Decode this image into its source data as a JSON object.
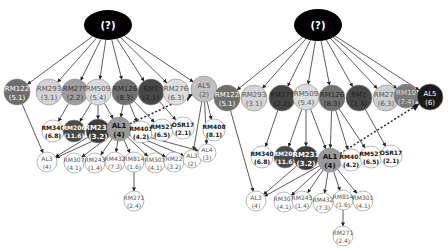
{
  "diagrams": [
    {
      "id": "left",
      "root": {
        "label": "(?)",
        "cx": 108,
        "cy": 25,
        "rx": 24,
        "ry": 15
      },
      "nodes": [
        {
          "id": "RM122",
          "name": "RM122",
          "value": "(5.1)",
          "x": 17,
          "y": 92,
          "r": 13,
          "fill": "#6e6e6e",
          "text": "#ffffff"
        },
        {
          "id": "RM293",
          "name": "RM293",
          "value": "(3.1)",
          "x": 49,
          "y": 92,
          "r": 13,
          "fill": "#d4d4d4",
          "text": "#555555"
        },
        {
          "id": "RM279",
          "name": "RM279",
          "value": "(2.2)",
          "x": 75,
          "y": 92,
          "r": 13,
          "fill": "#9e9e9e",
          "text": "#333333"
        },
        {
          "id": "RM509",
          "name": "RM509",
          "value": "(5.4)",
          "x": 98,
          "y": 92,
          "r": 13,
          "fill": "#dcdcdc",
          "text": "#555555"
        },
        {
          "id": "RM126",
          "name": "RM126",
          "value": "(8.3)",
          "x": 125,
          "y": 92,
          "r": 13,
          "fill": "#707070",
          "text": "#222222"
        },
        {
          "id": "RM1",
          "name": "RM1",
          "value": "(1.1)",
          "x": 151,
          "y": 92,
          "r": 13,
          "fill": "#474747",
          "text": "#222222"
        },
        {
          "id": "RM276",
          "name": "RM276",
          "value": "(6.3)",
          "x": 176,
          "y": 92,
          "r": 13,
          "fill": "#dedede",
          "text": "#555555"
        },
        {
          "id": "AL5",
          "name": "AL5",
          "value": "(2)",
          "x": 204,
          "y": 89,
          "r": 13,
          "fill": "#c0c0c0",
          "text": "#555555"
        },
        {
          "id": "RM340",
          "name": "RM340",
          "value": "(6.8)",
          "x": 53,
          "y": 131,
          "r": 11,
          "fill": "#ffffff",
          "text": "#111111",
          "bold": true
        },
        {
          "id": "RM206",
          "name": "RM206",
          "value": "(11.6)",
          "x": 74,
          "y": 131,
          "r": 11,
          "fill": "#4a4a4a",
          "text": "#ffffff",
          "bold": true
        },
        {
          "id": "RM231",
          "name": "RM231",
          "value": "(3.2)",
          "x": 98,
          "y": 131,
          "r": 12,
          "fill": "#3c3c3c",
          "text": "#ffffff",
          "bold": true
        },
        {
          "id": "AL1",
          "name": "AL1",
          "value": "(4)",
          "x": 119,
          "y": 129,
          "r": 12,
          "fill": "#9a9a9a",
          "text": "#111111",
          "bold": true
        },
        {
          "id": "RM401",
          "name": "RM401",
          "value": "(4.2)",
          "x": 141,
          "y": 132,
          "r": 11,
          "fill": "#ffffff",
          "text": "#111111",
          "bold": true
        },
        {
          "id": "RM527",
          "name": "RM527",
          "value": "(6.5)",
          "x": 162,
          "y": 130,
          "r": 11,
          "fill": "#ffffff",
          "text": "#111111",
          "bold": true
        },
        {
          "id": "OSR17",
          "name": "OSR17",
          "value": "(2.1)",
          "x": 183,
          "y": 128,
          "r": 11,
          "fill": "#ffffff",
          "text": "#111111",
          "bold": true
        },
        {
          "id": "RM408",
          "name": "RM408",
          "value": "(8.1)",
          "x": 214,
          "y": 130,
          "r": 11,
          "fill": "#ffffff",
          "text": "#111111",
          "bold": true
        },
        {
          "id": "AL3a",
          "name": "AL3",
          "value": "(4)",
          "x": 47,
          "y": 162,
          "r": 10,
          "fill": "#ffffff",
          "text": "#555555"
        },
        {
          "id": "RM307",
          "name": "RM307",
          "value": "(4.1)",
          "x": 74,
          "y": 163,
          "r": 10,
          "fill": "#ffffff",
          "text": "#555555"
        },
        {
          "id": "RM243",
          "name": "RM243",
          "value": "(1.4)",
          "x": 95,
          "y": 163,
          "r": 10,
          "fill": "#ffffff",
          "text": "#555555"
        },
        {
          "id": "RM432",
          "name": "RM432",
          "value": "(7.3)",
          "x": 115,
          "y": 162,
          "r": 10,
          "fill": "#ffffff",
          "text": "#555555"
        },
        {
          "id": "RM814",
          "name": "RM814",
          "value": "(1.6)",
          "x": 134,
          "y": 162,
          "r": 10,
          "fill": "#ffffff",
          "text": "#555555"
        },
        {
          "id": "RM301",
          "name": "RM301",
          "value": "(4.1)",
          "x": 155,
          "y": 163,
          "r": 10,
          "fill": "#ffffff",
          "text": "#555555"
        },
        {
          "id": "RM22",
          "name": "RM22",
          "value": "(3.2)",
          "x": 174,
          "y": 162,
          "r": 10,
          "fill": "#ffffff",
          "text": "#555555"
        },
        {
          "id": "AL3b",
          "name": "AL3",
          "value": "(2)",
          "x": 192,
          "y": 159,
          "r": 9,
          "fill": "#ffffff",
          "text": "#555555"
        },
        {
          "id": "AL4",
          "name": "AL4",
          "value": "(3)",
          "x": 207,
          "y": 153,
          "r": 9,
          "fill": "#ffffff",
          "text": "#555555"
        },
        {
          "id": "RM271",
          "name": "RM271",
          "value": "(2.4)",
          "x": 134,
          "y": 201,
          "r": 10,
          "fill": "#ffffff",
          "text": "#555555"
        }
      ],
      "edges": [
        [
          "root",
          "RM122"
        ],
        [
          "root",
          "RM293"
        ],
        [
          "root",
          "RM279"
        ],
        [
          "root",
          "RM509"
        ],
        [
          "root",
          "RM126"
        ],
        [
          "root",
          "RM1"
        ],
        [
          "root",
          "RM276"
        ],
        [
          "root",
          "AL5"
        ],
        [
          "RM279",
          "RM340"
        ],
        [
          "RM509",
          "RM206"
        ],
        [
          "RM509",
          "RM231"
        ],
        [
          "RM509",
          "AL1"
        ],
        [
          "RM126",
          "AL1"
        ],
        [
          "RM126",
          "RM401"
        ],
        [
          "RM126",
          "RM527"
        ],
        [
          "RM1",
          "OSR17"
        ],
        [
          "AL5",
          "RM408"
        ],
        [
          "AL5",
          "AL3b"
        ],
        [
          "AL5",
          "AL4"
        ],
        [
          "RM122",
          "AL3a"
        ],
        [
          "RM231",
          "AL3a"
        ],
        [
          "AL1",
          "AL3a"
        ],
        [
          "AL1",
          "RM307"
        ],
        [
          "AL1",
          "RM243"
        ],
        [
          "AL1",
          "RM432"
        ],
        [
          "AL1",
          "RM814"
        ],
        [
          "AL1",
          "RM301"
        ],
        [
          "AL1",
          "RM22"
        ],
        [
          "AL1",
          "AL3b"
        ],
        [
          "AL1",
          "AL4"
        ],
        [
          "RM814",
          "RM271"
        ]
      ],
      "dashed_edges": [
        [
          "AL1",
          "AL5"
        ]
      ]
    },
    {
      "id": "right",
      "root": {
        "label": "(?)",
        "cx": 318,
        "cy": 25,
        "rx": 24,
        "ry": 16
      },
      "nodes": [
        {
          "id": "RM122",
          "name": "RM122",
          "value": "(5.1)",
          "x": 227,
          "y": 98,
          "r": 13,
          "fill": "#6e6e6e",
          "text": "#ffffff"
        },
        {
          "id": "RM293",
          "name": "RM293",
          "value": "(3.1)",
          "x": 254,
          "y": 98,
          "r": 13,
          "fill": "#d4d4d4",
          "text": "#555555"
        },
        {
          "id": "RM279",
          "name": "RM279",
          "value": "(2.2)",
          "x": 282,
          "y": 98,
          "r": 13,
          "fill": "#454545",
          "text": "#222222"
        },
        {
          "id": "RM509",
          "name": "RM509",
          "value": "(5.4)",
          "x": 306,
          "y": 97,
          "r": 13,
          "fill": "#dcdcdc",
          "text": "#555555"
        },
        {
          "id": "RM126",
          "name": "RM126",
          "value": "(8.3)",
          "x": 332,
          "y": 98,
          "r": 13,
          "fill": "#707070",
          "text": "#222222"
        },
        {
          "id": "RM1",
          "name": "RM1",
          "value": "(1.3)",
          "x": 359,
          "y": 98,
          "r": 13,
          "fill": "#474747",
          "text": "#222222"
        },
        {
          "id": "RM276",
          "name": "RM276",
          "value": "(6.3)",
          "x": 386,
          "y": 98,
          "r": 13,
          "fill": "#cfcfcf",
          "text": "#555555"
        },
        {
          "id": "RM10",
          "name": "RM10",
          "value": "(7.4)",
          "x": 406,
          "y": 96,
          "r": 12,
          "fill": "#7a7a7a",
          "text": "#dddddd"
        },
        {
          "id": "AL5",
          "name": "AL5",
          "value": "(6)",
          "x": 430,
          "y": 97,
          "r": 13,
          "fill": "#1a1a1a",
          "text": "#ffffff"
        },
        {
          "id": "RM340",
          "name": "RM340",
          "value": "(6.8)",
          "x": 262,
          "y": 157,
          "r": 11,
          "fill": "#ffffff",
          "text": "#111111",
          "bold": true
        },
        {
          "id": "RM206",
          "name": "RM206",
          "value": "(11.6)",
          "x": 285,
          "y": 157,
          "r": 11,
          "fill": "#4a4a4a",
          "text": "#ffffff",
          "bold": true
        },
        {
          "id": "RM231",
          "name": "RM231",
          "value": "(3.2)",
          "x": 306,
          "y": 158,
          "r": 12,
          "fill": "#3c3c3c",
          "text": "#ffffff",
          "bold": true
        },
        {
          "id": "AL1",
          "name": "AL1",
          "value": "(4)",
          "x": 330,
          "y": 160,
          "r": 12,
          "fill": "#9a9a9a",
          "text": "#111111",
          "bold": true
        },
        {
          "id": "RM401",
          "name": "RM401",
          "value": "(4.2)",
          "x": 351,
          "y": 160,
          "r": 11,
          "fill": "#ffffff",
          "text": "#111111",
          "bold": true
        },
        {
          "id": "RM527",
          "name": "RM527",
          "value": "(6.5)",
          "x": 371,
          "y": 157,
          "r": 11,
          "fill": "#ffffff",
          "text": "#111111",
          "bold": true
        },
        {
          "id": "OSR17",
          "name": "OSR17",
          "value": "(2.1)",
          "x": 391,
          "y": 156,
          "r": 11,
          "fill": "#ffffff",
          "text": "#111111",
          "bold": true
        },
        {
          "id": "AL3",
          "name": "AL3",
          "value": "(4)",
          "x": 256,
          "y": 201,
          "r": 10,
          "fill": "#ffffff",
          "text": "#555555"
        },
        {
          "id": "RM307",
          "name": "RM307",
          "value": "(4.1)",
          "x": 284,
          "y": 202,
          "r": 10,
          "fill": "#ffffff",
          "text": "#555555"
        },
        {
          "id": "RM243",
          "name": "RM243",
          "value": "(1.4)",
          "x": 302,
          "y": 201,
          "r": 10,
          "fill": "#ffffff",
          "text": "#555555"
        },
        {
          "id": "RM432",
          "name": "RM432",
          "value": "(7.3)",
          "x": 323,
          "y": 203,
          "r": 10,
          "fill": "#ffffff",
          "text": "#555555"
        },
        {
          "id": "RM814",
          "name": "RM814",
          "value": "(1.6)",
          "x": 343,
          "y": 200,
          "r": 10,
          "fill": "#ffffff",
          "text": "#555555"
        },
        {
          "id": "RM301",
          "name": "RM301",
          "value": "(4.1)",
          "x": 363,
          "y": 201,
          "r": 10,
          "fill": "#ffffff",
          "text": "#555555"
        },
        {
          "id": "RM271",
          "name": "RM271",
          "value": "(2.4)",
          "x": 343,
          "y": 236,
          "r": 10,
          "fill": "#ffffff",
          "text": "#555555"
        }
      ],
      "edges": [
        [
          "root",
          "RM122"
        ],
        [
          "root",
          "RM293"
        ],
        [
          "root",
          "RM279"
        ],
        [
          "root",
          "RM509"
        ],
        [
          "root",
          "RM126"
        ],
        [
          "root",
          "RM1"
        ],
        [
          "root",
          "RM276"
        ],
        [
          "root",
          "RM10"
        ],
        [
          "root",
          "AL5"
        ],
        [
          "RM279",
          "RM340"
        ],
        [
          "RM509",
          "RM206"
        ],
        [
          "RM509",
          "RM231"
        ],
        [
          "RM509",
          "AL1"
        ],
        [
          "RM126",
          "AL1"
        ],
        [
          "RM126",
          "RM401"
        ],
        [
          "RM126",
          "RM527"
        ],
        [
          "RM1",
          "OSR17"
        ],
        [
          "RM122",
          "AL3"
        ],
        [
          "RM231",
          "AL3"
        ],
        [
          "AL1",
          "AL3"
        ],
        [
          "AL1",
          "RM307"
        ],
        [
          "AL1",
          "RM243"
        ],
        [
          "AL1",
          "RM432"
        ],
        [
          "AL1",
          "RM814"
        ],
        [
          "AL1",
          "RM301"
        ],
        [
          "RM814",
          "RM271"
        ]
      ],
      "dashed_edges": [
        [
          "AL1",
          "AL5"
        ]
      ]
    }
  ],
  "style": {
    "edge_color": "#333333",
    "node_stroke": "#888888",
    "root_fill": "#000000",
    "root_text": "#ffffff",
    "background": "#ffffff"
  }
}
